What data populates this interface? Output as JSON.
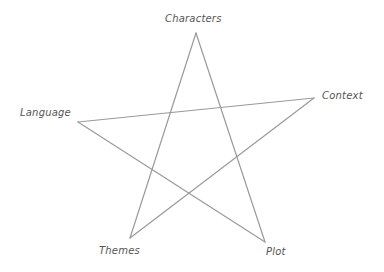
{
  "diagram": {
    "type": "pentagram",
    "stroke_color": "#9a9a9a",
    "label_color": "#555555",
    "vertices": [
      {
        "id": "characters",
        "label": "Characters",
        "x": 196,
        "y": 33
      },
      {
        "id": "context",
        "label": "Context",
        "x": 314,
        "y": 98
      },
      {
        "id": "plot",
        "label": "Plot",
        "x": 265,
        "y": 242
      },
      {
        "id": "themes",
        "label": "Themes",
        "x": 130,
        "y": 238
      },
      {
        "id": "language",
        "label": "Language",
        "x": 78,
        "y": 122
      }
    ],
    "edges": [
      [
        "characters",
        "plot"
      ],
      [
        "plot",
        "language"
      ],
      [
        "language",
        "context"
      ],
      [
        "context",
        "themes"
      ],
      [
        "themes",
        "characters"
      ]
    ]
  }
}
